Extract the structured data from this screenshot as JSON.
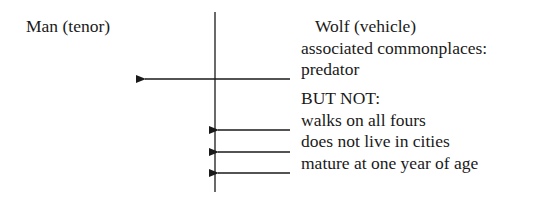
{
  "diagram": {
    "tenor_label": "Man (tenor)",
    "vehicle_label": "Wolf (vehicle)",
    "associated_header": "associated commonplaces:",
    "associated": [
      "predator"
    ],
    "exclusion_header": "BUT NOT:",
    "excluded": [
      "walks on all fours",
      "does not live in cities",
      "mature at one year of age"
    ],
    "colors": {
      "ink": "#1a1a1a",
      "background": "#ffffff"
    }
  }
}
